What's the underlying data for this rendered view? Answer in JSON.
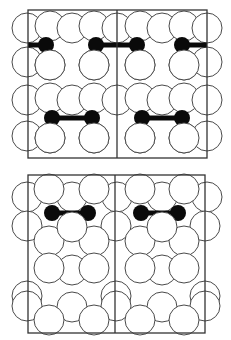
{
  "figure": {
    "width": 231,
    "height": 340,
    "stroke_color": "#4a4a4a",
    "frame_color": "#333333",
    "atom_fill": "#ffffff",
    "adsorbate_color": "#0a0a0a",
    "atom_radius": 15,
    "adsorbate_radius": 8
  },
  "panels": [
    {
      "id": "top",
      "frame": {
        "x": 28,
        "y": 10,
        "w": 179,
        "h": 148
      },
      "divider_x": 117,
      "rows": [
        {
          "layer": "back",
          "atoms": [
            [
              27,
              28
            ],
            [
              50,
              26
            ],
            [
              72,
              28
            ],
            [
              94,
              26
            ],
            [
              117,
              28
            ],
            [
              140,
              26
            ],
            [
              162,
              28
            ],
            [
              184,
              26
            ],
            [
              207,
              28
            ]
          ]
        },
        {
          "layer": "front",
          "atoms": [
            [
              27,
              62
            ],
            [
              50,
              65
            ],
            [
              94,
              65
            ],
            [
              140,
              65
            ],
            [
              184,
              65
            ],
            [
              207,
              62
            ]
          ]
        },
        {
          "layer": "back",
          "atoms": [
            [
              27,
              100
            ],
            [
              50,
              98
            ],
            [
              72,
              100
            ],
            [
              94,
              98
            ],
            [
              117,
              100
            ],
            [
              140,
              98
            ],
            [
              162,
              100
            ],
            [
              184,
              98
            ],
            [
              207,
              100
            ]
          ]
        },
        {
          "layer": "front",
          "atoms": [
            [
              27,
              136
            ],
            [
              50,
              138
            ],
            [
              94,
              138
            ],
            [
              140,
              138
            ],
            [
              184,
              138
            ],
            [
              207,
              136
            ]
          ]
        }
      ],
      "molecules": [
        {
          "a": [
            46,
            45
          ],
          "b": [
            28,
            45
          ],
          "bar": true,
          "cut": "left"
        },
        {
          "a": [
            96,
            45
          ],
          "b": [
            137,
            45
          ],
          "bar": true
        },
        {
          "a": [
            182,
            45
          ],
          "b": [
            207,
            45
          ],
          "bar": true,
          "cut": "right"
        },
        {
          "a": [
            52,
            118
          ],
          "b": [
            92,
            118
          ],
          "bar": true
        },
        {
          "a": [
            142,
            118
          ],
          "b": [
            182,
            118
          ],
          "bar": true
        }
      ],
      "front_overlay": [
        [
          50,
          65
        ],
        [
          94,
          65
        ],
        [
          140,
          65
        ],
        [
          184,
          65
        ],
        [
          50,
          138
        ],
        [
          94,
          138
        ],
        [
          140,
          138
        ],
        [
          184,
          138
        ]
      ]
    },
    {
      "id": "bottom",
      "frame": {
        "x": 28,
        "y": 175,
        "w": 177,
        "h": 158
      },
      "divider_x": 115,
      "rows": [
        {
          "layer": "back",
          "atoms": [
            [
              27,
              197
            ],
            [
              72,
              197
            ],
            [
              117,
              197
            ],
            [
              162,
              197
            ],
            [
              207,
              197
            ]
          ]
        },
        {
          "layer": "mid",
          "atoms": [
            [
              49,
              189
            ],
            [
              94,
              189
            ],
            [
              140,
              189
            ],
            [
              184,
              189
            ]
          ]
        },
        {
          "layer": "second",
          "atoms": [
            [
              27,
              226
            ],
            [
              116,
              226
            ],
            [
              205,
              226
            ]
          ]
        },
        {
          "layer": "third",
          "atoms": [
            [
              49,
              241
            ],
            [
              94,
              241
            ],
            [
              140,
              241
            ],
            [
              184,
              241
            ]
          ]
        },
        {
          "layer": "fourth",
          "atoms": [
            [
              72,
              270
            ],
            [
              162,
              270
            ]
          ]
        },
        {
          "layer": "fifth",
          "atoms": [
            [
              49,
              268
            ],
            [
              94,
              268
            ],
            [
              140,
              268
            ],
            [
              184,
              268
            ]
          ]
        },
        {
          "layer": "sixth",
          "atoms": [
            [
              27,
              296
            ],
            [
              116,
              296
            ],
            [
              205,
              296
            ]
          ]
        },
        {
          "layer": "seventh",
          "atoms": [
            [
              72,
              307
            ],
            [
              162,
              307
            ]
          ]
        },
        {
          "layer": "eighth",
          "atoms": [
            [
              27,
              306
            ],
            [
              116,
              306
            ],
            [
              205,
              306
            ]
          ]
        },
        {
          "layer": "ninth",
          "atoms": [
            [
              49,
              320
            ],
            [
              94,
              320
            ],
            [
              140,
              320
            ],
            [
              184,
              320
            ]
          ]
        }
      ],
      "molecules": [
        {
          "a": [
            52,
            213
          ],
          "b": [
            88,
            213
          ],
          "bar": true
        },
        {
          "a": [
            141,
            213
          ],
          "b": [
            178,
            213
          ],
          "bar": true
        }
      ],
      "front_overlay": [
        [
          72,
          227
        ],
        [
          162,
          227
        ]
      ]
    }
  ]
}
